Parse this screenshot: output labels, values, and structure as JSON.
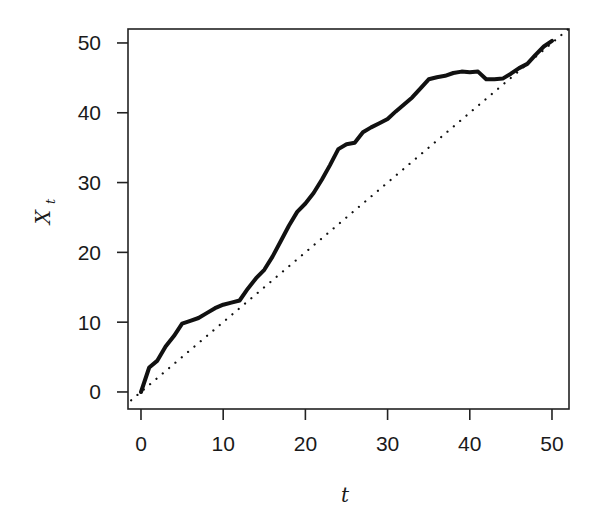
{
  "chart_data": {
    "type": "line",
    "title": "",
    "xlabel": "t",
    "ylabel": "X_t",
    "ylabel_main": "X",
    "ylabel_sub": "t",
    "xlim": [
      -1.58,
      52.07
    ],
    "ylim": [
      -2.44,
      52.0
    ],
    "xticks": [
      0,
      10,
      20,
      30,
      40,
      50
    ],
    "yticks": [
      0,
      10,
      20,
      30,
      40,
      50
    ],
    "xtick_labels": [
      "0",
      "10",
      "20",
      "30",
      "40",
      "50"
    ],
    "ytick_labels": [
      "0",
      "10",
      "20",
      "30",
      "40",
      "50"
    ],
    "grid": false,
    "legend": null,
    "series": [
      {
        "name": "X_t",
        "style": "solid-thick",
        "color": "#111111",
        "x": [
          0,
          1,
          2,
          3,
          4,
          5,
          6,
          7,
          8,
          9,
          10,
          11,
          12,
          13,
          14,
          15,
          16,
          17,
          18,
          19,
          20,
          21,
          22,
          23,
          24,
          25,
          26,
          27,
          28,
          29,
          30,
          31,
          32,
          33,
          34,
          35,
          36,
          37,
          38,
          39,
          40,
          41,
          42,
          43,
          44,
          45,
          46,
          47,
          48,
          49,
          50
        ],
        "values": [
          0,
          3.5,
          4.5,
          6.5,
          8,
          9.8,
          10.2,
          10.6,
          11.3,
          12,
          12.5,
          12.8,
          13.1,
          14.8,
          16.3,
          17.5,
          19.4,
          21.6,
          23.8,
          25.8,
          27,
          28.5,
          30.4,
          32.5,
          34.8,
          35.5,
          35.7,
          37.2,
          37.9,
          38.5,
          39.1,
          40.2,
          41.2,
          42.2,
          43.5,
          44.8,
          45.1,
          45.3,
          45.7,
          45.9,
          45.8,
          45.9,
          44.8,
          44.8,
          44.9,
          45.6,
          46.4,
          47,
          48.3,
          49.5,
          50.3
        ]
      },
      {
        "name": "y = t reference",
        "style": "dotted",
        "color": "#111111",
        "x": [
          -1.2,
          52
        ],
        "values": [
          -1.2,
          52
        ]
      }
    ]
  }
}
